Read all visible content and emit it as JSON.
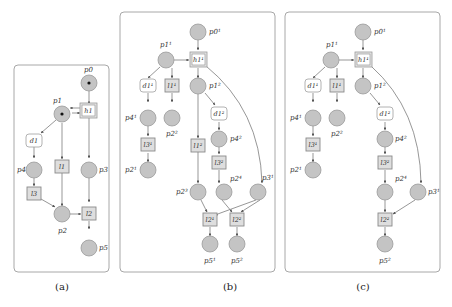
{
  "figure": {
    "panels": [
      {
        "id": "a",
        "caption": "(a)",
        "places": [
          {
            "id": "p0",
            "label": "p0",
            "tokens": 1
          },
          {
            "id": "p1",
            "label": "p1",
            "tokens": 1
          },
          {
            "id": "p4",
            "label": "p4",
            "tokens": 0
          },
          {
            "id": "p3",
            "label": "p3",
            "tokens": 0
          },
          {
            "id": "p2",
            "label": "p2",
            "tokens": 0
          },
          {
            "id": "p5",
            "label": "p5",
            "tokens": 0
          }
        ],
        "transitions": [
          {
            "id": "h1",
            "label": "h1",
            "kind": "hidden"
          },
          {
            "id": "d1",
            "label": "d1",
            "kind": "decision"
          },
          {
            "id": "l1",
            "label": "l1",
            "kind": "labeled"
          },
          {
            "id": "l3",
            "label": "l3",
            "kind": "labeled"
          },
          {
            "id": "l2",
            "label": "l2",
            "kind": "labeled"
          }
        ]
      },
      {
        "id": "b",
        "caption": "(b)",
        "places": [
          {
            "id": "p0_1",
            "label": "p0¹"
          },
          {
            "id": "p1_1",
            "label": "p1¹"
          },
          {
            "id": "p1_2",
            "label": "p1²"
          },
          {
            "id": "p4_1",
            "label": "p4¹"
          },
          {
            "id": "p2_2",
            "label": "p2²"
          },
          {
            "id": "p4_2",
            "label": "p4²"
          },
          {
            "id": "p2_1",
            "label": "p2¹"
          },
          {
            "id": "p2_3",
            "label": "p2³"
          },
          {
            "id": "p2_4",
            "label": "p2⁴"
          },
          {
            "id": "p3_1",
            "label": "p3¹"
          },
          {
            "id": "p5_1",
            "label": "p5¹"
          },
          {
            "id": "p5_2",
            "label": "p5²"
          }
        ],
        "transitions": [
          {
            "id": "h1_1",
            "label": "h1¹",
            "kind": "hidden"
          },
          {
            "id": "d1_1",
            "label": "d1¹",
            "kind": "decision"
          },
          {
            "id": "l1_1",
            "label": "l1¹",
            "kind": "labeled"
          },
          {
            "id": "d1_2",
            "label": "d1²",
            "kind": "decision"
          },
          {
            "id": "l3_1",
            "label": "l3¹",
            "kind": "labeled"
          },
          {
            "id": "l1_2",
            "label": "l1²",
            "kind": "labeled"
          },
          {
            "id": "l3_2",
            "label": "l3²",
            "kind": "labeled"
          },
          {
            "id": "l2_1",
            "label": "l2¹",
            "kind": "labeled"
          },
          {
            "id": "l2_2",
            "label": "l2²",
            "kind": "labeled"
          }
        ]
      },
      {
        "id": "c",
        "caption": "(c)",
        "places": [
          {
            "id": "p0_1",
            "label": "p0¹"
          },
          {
            "id": "p1_1",
            "label": "p1¹"
          },
          {
            "id": "p1_2",
            "label": "p1²"
          },
          {
            "id": "p4_1",
            "label": "p4¹"
          },
          {
            "id": "p2_2",
            "label": "p2²"
          },
          {
            "id": "p4_2",
            "label": "p4²"
          },
          {
            "id": "p2_1",
            "label": "p2¹"
          },
          {
            "id": "p2_4",
            "label": "p2⁴"
          },
          {
            "id": "p3_1",
            "label": "p3¹"
          },
          {
            "id": "p5_2",
            "label": "p5²"
          }
        ],
        "transitions": [
          {
            "id": "h1_1",
            "label": "h1¹",
            "kind": "hidden"
          },
          {
            "id": "d1_1",
            "label": "d1¹",
            "kind": "decision"
          },
          {
            "id": "l1_1",
            "label": "l1¹",
            "kind": "labeled"
          },
          {
            "id": "d1_2",
            "label": "d1²",
            "kind": "decision"
          },
          {
            "id": "l3_1",
            "label": "l3¹",
            "kind": "labeled"
          },
          {
            "id": "l3_2",
            "label": "l3²",
            "kind": "labeled"
          },
          {
            "id": "l2_2",
            "label": "l2²",
            "kind": "labeled"
          }
        ]
      }
    ]
  }
}
